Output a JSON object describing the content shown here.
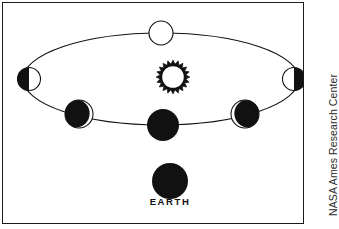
{
  "figure": {
    "background_color": "#ffffff",
    "ink_color": "#111111",
    "border_color": "#1a1a1a"
  },
  "diagram": {
    "earth_label": "EARTH",
    "sun": {
      "name": "sun",
      "label": "",
      "center_x": 170,
      "center_y": 74,
      "outer_radius": 17,
      "inner_radius": 11.5,
      "ray_count": 20,
      "fill": "#ffffff",
      "stroke": "#111111"
    },
    "earth": {
      "name": "earth",
      "center_x": 167,
      "center_y": 178,
      "radius": 18,
      "fill": "#111111"
    },
    "orbit": {
      "name": "moon-orbit-ellipse",
      "center_x": 158,
      "center_y": 76,
      "radius_x": 138,
      "radius_y": 46,
      "stroke": "#111111",
      "stroke_width": 1.1
    },
    "moons": [
      {
        "name": "moon-top",
        "phase": "fully-lit",
        "center_x": 158,
        "center_y": 30,
        "radius": 12,
        "lit_fraction": 1.0,
        "lit_side": "none",
        "outline": true
      },
      {
        "name": "moon-left",
        "phase": "half-dark-left",
        "center_x": 26,
        "center_y": 76,
        "radius": 11.5,
        "lit_fraction": 0.5,
        "lit_side": "right",
        "outline": true
      },
      {
        "name": "moon-right",
        "phase": "half-dark-right",
        "center_x": 291,
        "center_y": 76,
        "radius": 11.5,
        "lit_fraction": 0.5,
        "lit_side": "left",
        "outline": true
      },
      {
        "name": "moon-lower-left",
        "phase": "crescent-lit-right",
        "center_x": 76,
        "center_y": 111,
        "radius": 14,
        "lit_fraction": 0.12,
        "lit_side": "right",
        "outline": true
      },
      {
        "name": "moon-lower-right",
        "phase": "crescent-lit-left",
        "center_x": 242,
        "center_y": 111,
        "radius": 14,
        "lit_fraction": 0.12,
        "lit_side": "left",
        "outline": true
      },
      {
        "name": "moon-bottom",
        "phase": "fully-dark",
        "center_x": 160,
        "center_y": 122,
        "radius": 16,
        "lit_fraction": 0.0,
        "lit_side": "none",
        "outline": false
      }
    ]
  },
  "credit": {
    "text": "NASA Ames Research Center"
  }
}
